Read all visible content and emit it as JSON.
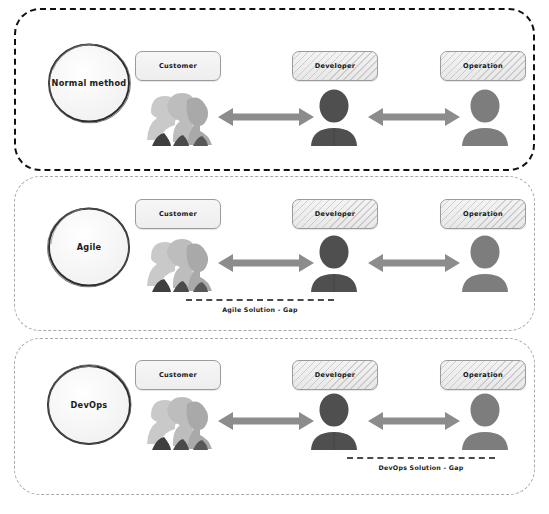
{
  "diagram": {
    "colors": {
      "band_solid_border": "#111111",
      "band_dashed_border": "#a8a8a8",
      "arrow": "#8c8c8c",
      "avatar_developer": "#4f4f4f",
      "avatar_operation": "#7d7d7d",
      "avatar_customer": "#bdbdbd",
      "gap_line": "#4a4a4a",
      "box_border": "#9b9b9b",
      "text": "#1b1b1b"
    },
    "role_labels": {
      "customer": "Customer",
      "developer": "Developer",
      "operation": "Operation"
    },
    "icons": {
      "customer": "people-group-icon",
      "developer": "person-icon",
      "operation": "person-icon",
      "link": "double-headed-arrow-icon"
    },
    "bands": [
      {
        "id": "normal-method",
        "method_label": "Normal method",
        "border_style": "solid-black-dashed",
        "roles": [
          "Customer",
          "Developer",
          "Operation"
        ],
        "arrows": [
          "customer-developer",
          "developer-operation"
        ],
        "gap": null
      },
      {
        "id": "agile",
        "method_label": "Agile",
        "border_style": "light-gray-dashed",
        "roles": [
          "Customer",
          "Developer",
          "Operation"
        ],
        "arrows": [
          "customer-developer",
          "developer-operation"
        ],
        "gap": {
          "label": "Agile Solution - Gap",
          "spans": "customer-to-developer"
        }
      },
      {
        "id": "devops",
        "method_label": "DevOps",
        "border_style": "light-gray-dashed",
        "roles": [
          "Customer",
          "Developer",
          "Operation"
        ],
        "arrows": [
          "customer-developer",
          "developer-operation"
        ],
        "gap": {
          "label": "DevOps Solution - Gap",
          "spans": "developer-to-operation"
        }
      }
    ]
  }
}
